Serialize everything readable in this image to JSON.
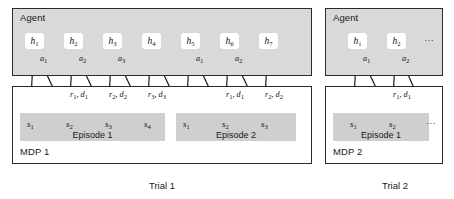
{
  "figure": {
    "type": "meta-rl-trial-structure-diagram"
  },
  "colors": {
    "agent_box_fill": "#d9d9d9",
    "mdp_box_fill": "#ffffff",
    "episode_band_fill": "#cfcfcf",
    "node_fill": "#ffffff",
    "stroke": "#2b2b2b",
    "text": "#1a1a1a"
  },
  "panels": [
    {
      "id": "trial-1",
      "trial_label": "Trial 1",
      "agent_label": "Agent",
      "mdp_label": "MDP 1",
      "hidden_states": [
        "h1",
        "h2",
        "h3",
        "h4",
        "h5",
        "h6",
        "h7"
      ],
      "hidden_states_display": [
        "h",
        "h",
        "h",
        "h",
        "h",
        "h",
        "h"
      ],
      "hidden_state_subs": [
        "1",
        "2",
        "3",
        "4",
        "5",
        "6",
        "7"
      ],
      "truncated": false,
      "episodes": [
        {
          "label": "Episode 1",
          "states_display": [
            "s",
            "s",
            "s",
            "s"
          ],
          "state_subs": [
            "1",
            "2",
            "3",
            "4"
          ],
          "truncated": false,
          "actions": [
            {
              "sym": "a",
              "sub": "1"
            },
            {
              "sym": "a",
              "sub": "2"
            },
            {
              "sym": "a",
              "sub": "3"
            }
          ],
          "rewards": [
            {
              "text": "r",
              "sub1": "1",
              "text2": ", d",
              "sub2": "1"
            },
            {
              "text": "r",
              "sub1": "2",
              "text2": ", d",
              "sub2": "2"
            },
            {
              "text": "r",
              "sub1": "3",
              "text2": ", d",
              "sub2": "3"
            }
          ]
        },
        {
          "label": "Episode 2",
          "states_display": [
            "s",
            "s",
            "s"
          ],
          "state_subs": [
            "1",
            "2",
            "3"
          ],
          "truncated": false,
          "actions": [
            {
              "sym": "a",
              "sub": "1"
            },
            {
              "sym": "a",
              "sub": "2"
            }
          ],
          "rewards": [
            {
              "text": "r",
              "sub1": "1",
              "text2": ", d",
              "sub2": "1"
            },
            {
              "text": "r",
              "sub1": "2",
              "text2": ", d",
              "sub2": "2"
            }
          ]
        }
      ]
    },
    {
      "id": "trial-2",
      "trial_label": "Trial 2",
      "agent_label": "Agent",
      "mdp_label": "MDP 2",
      "hidden_states": [
        "h1",
        "h2"
      ],
      "hidden_states_display": [
        "h",
        "h"
      ],
      "hidden_state_subs": [
        "1",
        "2"
      ],
      "truncated": true,
      "truncation_glyph": "⋯",
      "episodes": [
        {
          "label": "Episode 1",
          "states_display": [
            "s",
            "s"
          ],
          "state_subs": [
            "1",
            "2"
          ],
          "truncated": true,
          "truncation_glyph": "⋯",
          "actions": [
            {
              "sym": "a",
              "sub": "1"
            },
            {
              "sym": "a",
              "sub": "2"
            }
          ],
          "rewards": [
            {
              "text": "r",
              "sub1": "1",
              "text2": ", d",
              "sub2": "1"
            }
          ]
        }
      ]
    }
  ]
}
